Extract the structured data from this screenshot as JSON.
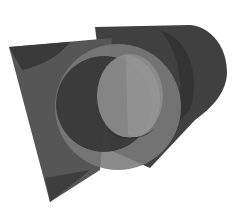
{
  "image": {
    "description": "3D-rendered translucent grayscale geometric shapes: a tilted flat quadrilateral plane intersected by a horizontal cylinder with a circular cross-section ring",
    "background": "#ffffff",
    "colors": {
      "plane": "#4a4a4a",
      "plane_light": "#6a6a6a",
      "cylinder_body": "#3e3e3e",
      "ring_outer": "#7a7a7a",
      "inner_dark": "#353535",
      "inner_light": "#8a8a8a"
    }
  }
}
